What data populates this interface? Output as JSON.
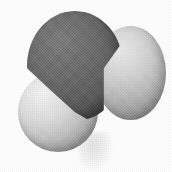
{
  "image": {
    "title": "Space-filling molecular model",
    "subject": "water molecule",
    "formula": "H2O",
    "style": "CPK space-filling model, grayscale photograph",
    "background_color": "#ffffff",
    "width": 172,
    "height": 172
  },
  "atoms": [
    {
      "name": "oxygen",
      "element": "O",
      "role": "central atom",
      "shade": "dark gray",
      "color": "#616161",
      "highlight_color": "#7d7d7d",
      "shadow_color": "#3e3e3e",
      "position": "upper-center",
      "relative_size": "large"
    },
    {
      "name": "hydrogen-left",
      "element": "H",
      "role": "terminal atom",
      "shade": "light gray",
      "color": "#cfcfcf",
      "highlight_color": "#f4f4f4",
      "shadow_color": "#7c7c7c",
      "position": "lower-left",
      "relative_size": "small"
    },
    {
      "name": "hydrogen-right",
      "element": "H",
      "role": "terminal atom",
      "shade": "light gray",
      "color": "#c4c4c4",
      "highlight_color": "#eaeaea",
      "shadow_color": "#7f7f7f",
      "position": "right",
      "relative_size": "small"
    }
  ],
  "artifacts": {
    "scan_smudge": "faint gray scanning smudge below center",
    "paper_grain": "halftone print grain across background"
  }
}
